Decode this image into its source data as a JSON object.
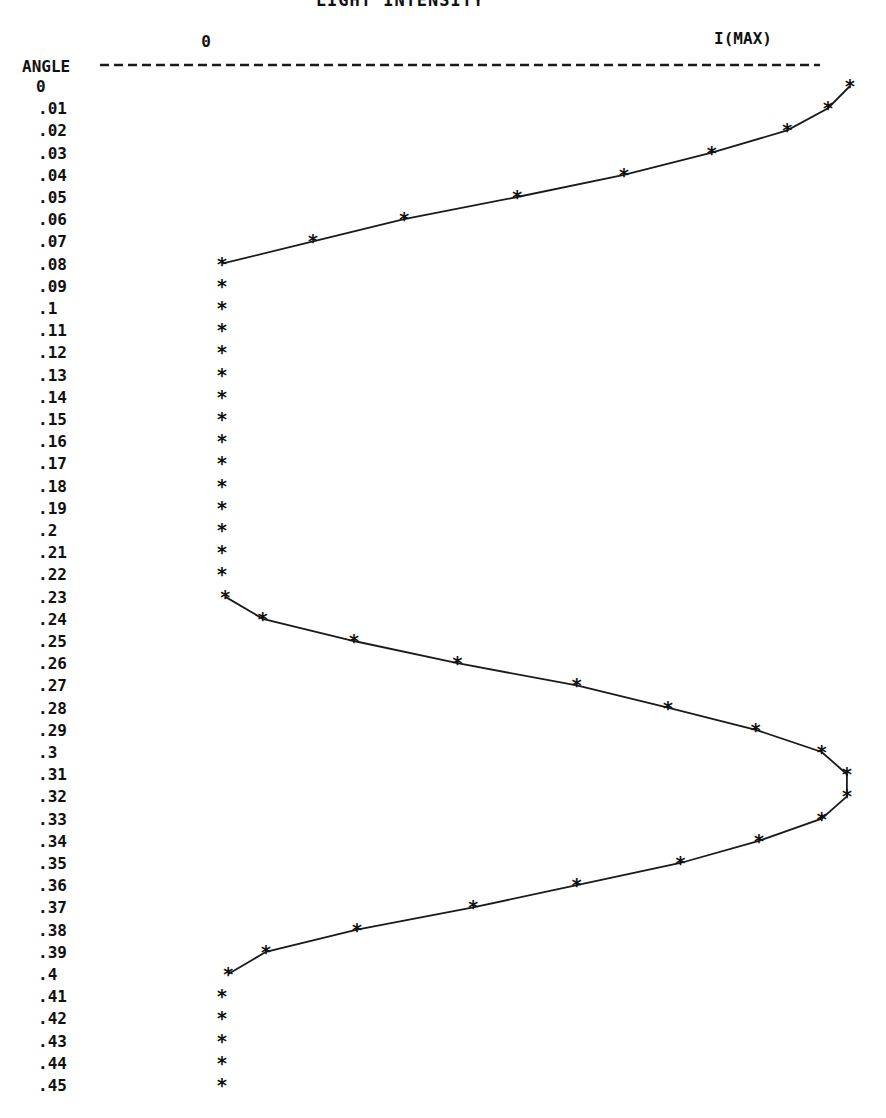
{
  "chart_data": {
    "type": "line",
    "title": "LIGHT INTENSITY",
    "xlabel": "LIGHT INTENSITY",
    "ylabel": "ANGLE",
    "x_axis": {
      "min_label": "0",
      "max_label": "I(MAX)",
      "range": [
        0,
        1
      ]
    },
    "orientation": "vertical (angle increases downward, intensity to the right)",
    "marker": "*",
    "grid": false,
    "legend": null,
    "categories": [
      "0",
      ".01",
      ".02",
      ".03",
      ".04",
      ".05",
      ".06",
      ".07",
      ".08",
      ".09",
      ".1",
      ".11",
      ".12",
      ".13",
      ".14",
      ".15",
      ".16",
      ".17",
      ".18",
      ".19",
      ".2",
      ".21",
      ".22",
      ".23",
      ".24",
      ".25",
      ".26",
      ".27",
      ".28",
      ".29",
      ".3",
      ".31",
      ".32",
      ".33",
      ".34",
      ".35",
      ".36",
      ".37",
      ".38",
      ".39",
      ".4",
      ".41",
      ".42",
      ".43",
      ".44",
      ".45"
    ],
    "angles": [
      0,
      0.01,
      0.02,
      0.03,
      0.04,
      0.05,
      0.06,
      0.07,
      0.08,
      0.09,
      0.1,
      0.11,
      0.12,
      0.13,
      0.14,
      0.15,
      0.16,
      0.17,
      0.18,
      0.19,
      0.2,
      0.21,
      0.22,
      0.23,
      0.24,
      0.25,
      0.26,
      0.27,
      0.28,
      0.29,
      0.3,
      0.31,
      0.32,
      0.33,
      0.34,
      0.35,
      0.36,
      0.37,
      0.38,
      0.39,
      0.4,
      0.41,
      0.42,
      0.43,
      0.44,
      0.45
    ],
    "series": [
      {
        "name": "Light intensity (fraction of I(MAX))",
        "values": [
          1.0,
          0.965,
          0.9,
          0.78,
          0.64,
          0.47,
          0.29,
          0.145,
          0.0,
          0.0,
          0.0,
          0.0,
          0.0,
          0.0,
          0.0,
          0.0,
          0.0,
          0.0,
          0.0,
          0.0,
          0.0,
          0.0,
          0.0,
          0.005,
          0.065,
          0.21,
          0.375,
          0.565,
          0.71,
          0.85,
          0.955,
          0.995,
          0.995,
          0.955,
          0.855,
          0.73,
          0.565,
          0.4,
          0.215,
          0.07,
          0.01,
          0.0,
          0.0,
          0.0,
          0.0,
          0.0
        ],
        "connected_range": [
          [
            0,
            8
          ],
          [
            23,
            40
          ]
        ]
      }
    ]
  },
  "header": {
    "title": "LIGHT INTENSITY",
    "zero_label": "0",
    "max_label": "I(MAX)",
    "angle_label": "ANGLE"
  }
}
